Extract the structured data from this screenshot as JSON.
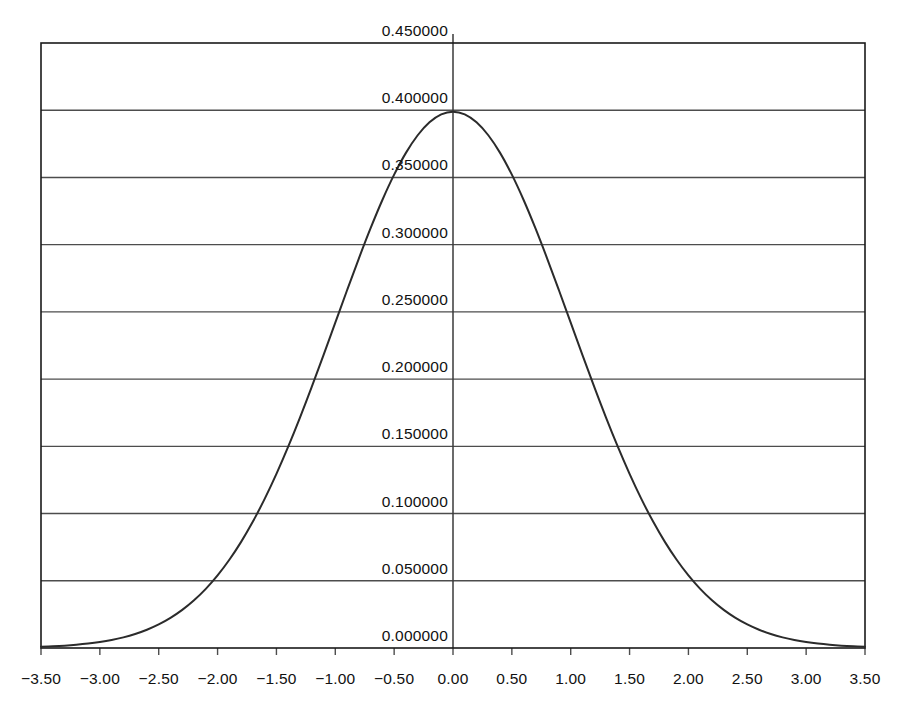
{
  "chart_data": {
    "type": "line",
    "title": "",
    "subtitle": "",
    "xlabel": "",
    "ylabel": "",
    "xlim": [
      -3.5,
      3.5
    ],
    "ylim": [
      0.0,
      0.45
    ],
    "grid": "horizontal",
    "legend": "none",
    "x_tick_labels": [
      "−3.50",
      "−3.00",
      "−2.50",
      "−2.00",
      "−1.50",
      "−1.00",
      "−0.50",
      "0.00",
      "0.50",
      "1.00",
      "1.50",
      "2.00",
      "2.50",
      "3.00",
      "3.50"
    ],
    "x_tick_values": [
      -3.5,
      -3.0,
      -2.5,
      -2.0,
      -1.5,
      -1.0,
      -0.5,
      0.0,
      0.5,
      1.0,
      1.5,
      2.0,
      2.5,
      3.0,
      3.5
    ],
    "y_tick_labels": [
      "0.000000",
      "0.050000",
      "0.100000",
      "0.150000",
      "0.200000",
      "0.250000",
      "0.300000",
      "0.350000",
      "0.400000",
      "0.450000"
    ],
    "y_tick_values": [
      0.0,
      0.05,
      0.1,
      0.15,
      0.2,
      0.25,
      0.3,
      0.35,
      0.4,
      0.45
    ],
    "series": [
      {
        "name": "standard normal pdf",
        "color": "#2b2b2b",
        "line_width": 2,
        "x": [
          -3.5,
          -3.4,
          -3.3,
          -3.2,
          -3.1,
          -3.0,
          -2.9,
          -2.8,
          -2.7,
          -2.6,
          -2.5,
          -2.4,
          -2.3,
          -2.2,
          -2.1,
          -2.0,
          -1.9,
          -1.8,
          -1.7,
          -1.6,
          -1.5,
          -1.4,
          -1.3,
          -1.2,
          -1.1,
          -1.0,
          -0.9,
          -0.8,
          -0.7,
          -0.6,
          -0.5,
          -0.4,
          -0.3,
          -0.2,
          -0.1,
          0.0,
          0.1,
          0.2,
          0.3,
          0.4,
          0.5,
          0.6,
          0.7,
          0.8,
          0.9,
          1.0,
          1.1,
          1.2,
          1.3,
          1.4,
          1.5,
          1.6,
          1.7,
          1.8,
          1.9,
          2.0,
          2.1,
          2.2,
          2.3,
          2.4,
          2.5,
          2.6,
          2.7,
          2.8,
          2.9,
          3.0,
          3.1,
          3.2,
          3.3,
          3.4,
          3.5
        ],
        "y": [
          0.000873,
          0.001232,
          0.001723,
          0.002384,
          0.003267,
          0.004432,
          0.005953,
          0.007915,
          0.010421,
          0.013583,
          0.017528,
          0.022395,
          0.028327,
          0.035475,
          0.043984,
          0.053991,
          0.065616,
          0.07895,
          0.094049,
          0.110921,
          0.129518,
          0.149727,
          0.171369,
          0.194186,
          0.217852,
          0.241971,
          0.266085,
          0.289692,
          0.312254,
          0.333225,
          0.352065,
          0.36827,
          0.381388,
          0.391043,
          0.396953,
          0.398942,
          0.396953,
          0.391043,
          0.381388,
          0.36827,
          0.352065,
          0.333225,
          0.312254,
          0.289692,
          0.266085,
          0.241971,
          0.217852,
          0.194186,
          0.171369,
          0.149727,
          0.129518,
          0.110921,
          0.094049,
          0.07895,
          0.065616,
          0.053991,
          0.043984,
          0.035475,
          0.028327,
          0.022395,
          0.017528,
          0.013583,
          0.010421,
          0.007915,
          0.005953,
          0.004432,
          0.003267,
          0.002384,
          0.001723,
          0.001232,
          0.000873
        ]
      }
    ],
    "annotations": [],
    "peak": {
      "x": 0.0,
      "y": 0.398942
    }
  },
  "style": {
    "plot_border_color": "#1a1a1a",
    "gridline_color": "#4d4d4d",
    "vertical_axis_color": "#3a3a3a",
    "tick_color": "#4d4d4d",
    "background": "#ffffff",
    "text_color": "#111111"
  },
  "geometry": {
    "plot_left": 41,
    "plot_right": 865,
    "plot_top": 43,
    "plot_bottom": 648,
    "zero_x_px": 453
  }
}
